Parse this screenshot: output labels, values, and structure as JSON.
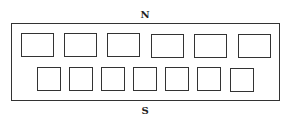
{
  "diagram": {
    "labels": {
      "north": "N",
      "south": "S"
    },
    "outer": {
      "x": 11,
      "y": 23,
      "w": 269,
      "h": 78
    },
    "rows": [
      {
        "name": "north-row",
        "count": 6,
        "boxes": [
          {
            "x": 21,
            "y": 33,
            "w": 33,
            "h": 24
          },
          {
            "x": 64,
            "y": 33,
            "w": 33,
            "h": 24
          },
          {
            "x": 107,
            "y": 33,
            "w": 33,
            "h": 24
          },
          {
            "x": 151,
            "y": 34,
            "w": 33,
            "h": 24
          },
          {
            "x": 194,
            "y": 34,
            "w": 33,
            "h": 24
          },
          {
            "x": 238,
            "y": 34,
            "w": 33,
            "h": 24
          }
        ]
      },
      {
        "name": "south-row",
        "count": 7,
        "boxes": [
          {
            "x": 37,
            "y": 67,
            "w": 24,
            "h": 24
          },
          {
            "x": 69,
            "y": 67,
            "w": 24,
            "h": 24
          },
          {
            "x": 101,
            "y": 67,
            "w": 24,
            "h": 24
          },
          {
            "x": 133,
            "y": 67,
            "w": 24,
            "h": 24
          },
          {
            "x": 165,
            "y": 67,
            "w": 24,
            "h": 24
          },
          {
            "x": 197,
            "y": 67,
            "w": 24,
            "h": 24
          },
          {
            "x": 230,
            "y": 68,
            "w": 24,
            "h": 24
          }
        ]
      }
    ]
  }
}
